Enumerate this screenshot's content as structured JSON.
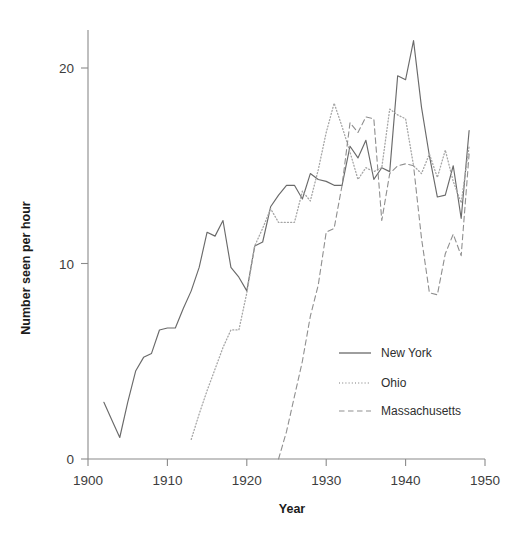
{
  "chart_data": {
    "type": "line",
    "title": "",
    "xlabel": "Year",
    "ylabel": "Number seen per hour",
    "xlim": [
      1900,
      1950
    ],
    "ylim": [
      0,
      22.6
    ],
    "xticks": [
      1900,
      1910,
      1920,
      1930,
      1940,
      1950
    ],
    "yticks": [
      0,
      10,
      20
    ],
    "grid": false,
    "legend_position": "center-right",
    "series": [
      {
        "name": "New York",
        "style": "solid",
        "color": "#6a6a6a",
        "x": [
          1902,
          1903,
          1904,
          1905,
          1906,
          1907,
          1908,
          1909,
          1910,
          1911,
          1912,
          1913,
          1914,
          1915,
          1916,
          1917,
          1918,
          1919,
          1920,
          1921,
          1922,
          1923,
          1924,
          1925,
          1926,
          1927,
          1928,
          1929,
          1930,
          1931,
          1932,
          1933,
          1934,
          1935,
          1936,
          1937,
          1938,
          1939,
          1940,
          1941,
          1942,
          1943,
          1944,
          1945,
          1946,
          1947,
          1948
        ],
        "y": [
          2.9,
          2.0,
          1.1,
          2.9,
          4.5,
          5.2,
          5.4,
          6.6,
          6.7,
          6.7,
          7.7,
          8.6,
          9.8,
          11.6,
          11.4,
          12.2,
          9.8,
          9.3,
          8.6,
          10.9,
          11.1,
          12.9,
          13.5,
          14.0,
          14.0,
          13.3,
          14.6,
          14.3,
          14.2,
          14.0,
          14.0,
          16.0,
          15.4,
          16.3,
          14.3,
          14.9,
          14.7,
          19.6,
          19.4,
          21.4,
          18.0,
          15.5,
          13.4,
          13.5,
          15.0,
          12.3,
          16.8
        ]
      },
      {
        "name": "Ohio",
        "style": "dotted",
        "color": "#a6a6a6",
        "x": [
          1913,
          1914,
          1915,
          1916,
          1917,
          1918,
          1919,
          1920,
          1921,
          1922,
          1923,
          1924,
          1925,
          1926,
          1927,
          1928,
          1929,
          1930,
          1931,
          1932,
          1933,
          1934,
          1935,
          1936,
          1937,
          1938,
          1939,
          1940,
          1941,
          1942,
          1943,
          1944,
          1945,
          1946,
          1947,
          1948
        ],
        "y": [
          1.0,
          2.3,
          3.5,
          4.6,
          5.7,
          6.6,
          6.6,
          8.5,
          10.9,
          11.8,
          12.8,
          12.1,
          12.1,
          12.1,
          13.7,
          13.2,
          14.8,
          16.7,
          18.2,
          17.0,
          15.7,
          14.3,
          14.9,
          14.7,
          14.9,
          17.9,
          17.6,
          17.4,
          15.0,
          14.6,
          15.6,
          14.4,
          15.8,
          14.2,
          13.1,
          16.0
        ]
      },
      {
        "name": "Massachusetts",
        "style": "dashed",
        "color": "#8f8f8f",
        "x": [
          1924,
          1925,
          1926,
          1927,
          1928,
          1929,
          1930,
          1931,
          1932,
          1933,
          1934,
          1935,
          1936,
          1937,
          1938,
          1939,
          1940,
          1941,
          1942,
          1943,
          1944,
          1945,
          1946,
          1947,
          1948
        ],
        "y": [
          0.0,
          1.4,
          3.2,
          5.0,
          7.3,
          8.9,
          11.6,
          11.8,
          14.0,
          17.2,
          16.7,
          17.5,
          17.4,
          12.2,
          14.6,
          15.0,
          15.1,
          15.0,
          11.3,
          8.5,
          8.4,
          10.5,
          11.5,
          10.4,
          15.6
        ]
      }
    ]
  },
  "axes": {
    "x_tick_labels": [
      "1900",
      "1910",
      "1920",
      "1930",
      "1940",
      "1950"
    ],
    "y_tick_labels": [
      "0",
      "10",
      "20"
    ],
    "x_axis_title": "Year",
    "y_axis_title": "Number seen per hour"
  },
  "legend": {
    "items": [
      {
        "label": "New York",
        "style": "solid"
      },
      {
        "label": "Ohio",
        "style": "dotted"
      },
      {
        "label": "Massachusetts",
        "style": "dashed"
      }
    ]
  }
}
